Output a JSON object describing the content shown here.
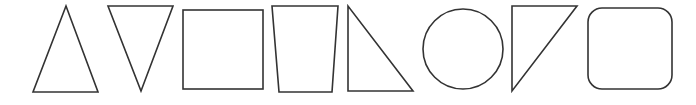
{
  "figure": {
    "width": 696,
    "height": 105,
    "background": "#ffffff",
    "stroke_color": "#333333",
    "stroke_width": 1.6
  },
  "shapes": [
    {
      "id": "triangle-up",
      "label": "isosceles triangle (point up)",
      "kind": "polygon",
      "points": "66,6 33,92 98,92"
    },
    {
      "id": "triangle-down",
      "label": "isosceles triangle (point down)",
      "kind": "polygon",
      "points": "108,6 173,6 141,91"
    },
    {
      "id": "square",
      "label": "square",
      "kind": "rect",
      "x": 183,
      "y": 10,
      "w": 80,
      "h": 79,
      "r": 0
    },
    {
      "id": "trapezoid",
      "label": "inverted trapezoid",
      "kind": "polygon",
      "points": "272,6 338,6 332,92 279,92"
    },
    {
      "id": "right-triangle",
      "label": "right triangle",
      "kind": "polygon",
      "points": "348,6 348,91 413,91"
    },
    {
      "id": "circle",
      "label": "circle",
      "kind": "circle",
      "cx": 463,
      "cy": 49,
      "r": 40
    },
    {
      "id": "right-triangle-flipped",
      "label": "right triangle (flipped)",
      "kind": "polygon",
      "points": "512,6 577,6 512,91"
    },
    {
      "id": "rounded-square",
      "label": "rounded square",
      "kind": "rect",
      "x": 588,
      "y": 8,
      "w": 84,
      "h": 81,
      "r": 14
    }
  ]
}
